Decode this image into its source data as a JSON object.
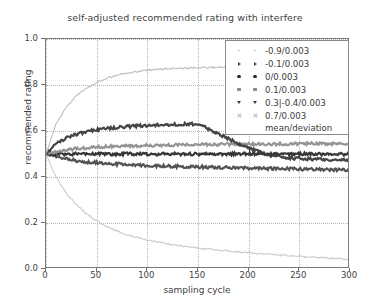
{
  "chart_data": {
    "type": "line",
    "title": "self-adjusted recommended rating with interfere",
    "xlabel": "sampling cycle",
    "ylabel": "recommended rating",
    "xlim": [
      0,
      300
    ],
    "ylim": [
      0.0,
      1.0
    ],
    "xticks": [
      0,
      50,
      100,
      150,
      200,
      250,
      300
    ],
    "yticks": [
      "0.0",
      "0.2",
      "0.4",
      "0.6",
      "0.8",
      "1.0"
    ],
    "grid": true,
    "legend_position": "upper right",
    "legend_caption": "mean/deviation",
    "series": [
      {
        "name": "-0.9/0.003",
        "marker": "dot",
        "color": "#b9b9b9",
        "x": [
          0,
          10,
          20,
          30,
          40,
          50,
          60,
          70,
          80,
          90,
          100,
          120,
          140,
          160,
          180,
          200,
          220,
          240,
          260,
          280,
          300
        ],
        "values": [
          0.5,
          0.4,
          0.33,
          0.28,
          0.24,
          0.21,
          0.185,
          0.165,
          0.15,
          0.137,
          0.126,
          0.109,
          0.096,
          0.086,
          0.078,
          0.071,
          0.064,
          0.058,
          0.052,
          0.047,
          0.042
        ]
      },
      {
        "name": "-0.1/0.003",
        "marker": "right-triangle",
        "color": "#4a4a4a",
        "x": [
          0,
          10,
          20,
          30,
          40,
          50,
          60,
          70,
          80,
          90,
          100,
          120,
          140,
          160,
          180,
          200,
          220,
          240,
          260,
          280,
          300
        ],
        "values": [
          0.5,
          0.487,
          0.478,
          0.471,
          0.466,
          0.462,
          0.459,
          0.456,
          0.454,
          0.452,
          0.45,
          0.447,
          0.445,
          0.443,
          0.441,
          0.439,
          0.437,
          0.435,
          0.434,
          0.432,
          0.43
        ]
      },
      {
        "name": "0/0.003",
        "marker": "circle",
        "color": "#2b2b2b",
        "x": [
          0,
          10,
          20,
          30,
          40,
          50,
          60,
          70,
          80,
          90,
          100,
          120,
          140,
          160,
          180,
          200,
          220,
          240,
          260,
          280,
          300
        ],
        "values": [
          0.5,
          0.5,
          0.499,
          0.5,
          0.501,
          0.5,
          0.499,
          0.5,
          0.501,
          0.5,
          0.499,
          0.5,
          0.5,
          0.499,
          0.5,
          0.501,
          0.5,
          0.499,
          0.5,
          0.5,
          0.499
        ]
      },
      {
        "name": "0.1/0.003",
        "marker": "square",
        "color": "#8e8e8e",
        "x": [
          0,
          10,
          20,
          30,
          40,
          50,
          60,
          70,
          80,
          90,
          100,
          120,
          140,
          160,
          180,
          200,
          220,
          240,
          260,
          280,
          300
        ],
        "values": [
          0.5,
          0.511,
          0.518,
          0.523,
          0.527,
          0.53,
          0.532,
          0.534,
          0.535,
          0.536,
          0.537,
          0.539,
          0.54,
          0.541,
          0.542,
          0.543,
          0.543,
          0.544,
          0.545,
          0.545,
          0.546
        ]
      },
      {
        "name": "0.3|-0.4/0.003",
        "marker": "down-triangle",
        "color": "#3a3a3a",
        "x": [
          0,
          10,
          20,
          30,
          40,
          50,
          60,
          70,
          80,
          90,
          100,
          120,
          140,
          150,
          160,
          180,
          200,
          220,
          240,
          260,
          280,
          300
        ],
        "values": [
          0.5,
          0.545,
          0.57,
          0.586,
          0.597,
          0.605,
          0.611,
          0.615,
          0.619,
          0.622,
          0.624,
          0.628,
          0.63,
          0.631,
          0.61,
          0.566,
          0.525,
          0.495,
          0.482,
          0.478,
          0.476,
          0.474
        ]
      },
      {
        "name": "0.7/0.003",
        "marker": "x",
        "color": "#a9a9a9",
        "x": [
          0,
          10,
          20,
          30,
          40,
          50,
          60,
          70,
          80,
          90,
          100,
          120,
          140,
          160,
          180,
          200,
          220,
          240,
          260,
          280,
          300
        ],
        "values": [
          0.5,
          0.63,
          0.704,
          0.753,
          0.787,
          0.811,
          0.829,
          0.842,
          0.852,
          0.859,
          0.864,
          0.871,
          0.874,
          0.876,
          0.877,
          0.877,
          0.877,
          0.876,
          0.876,
          0.875,
          0.874
        ]
      }
    ]
  }
}
